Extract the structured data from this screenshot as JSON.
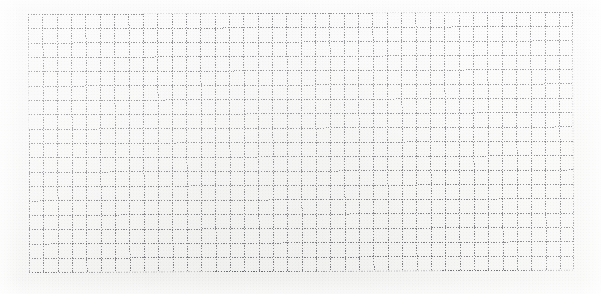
{
  "document": {
    "type": "graph-paper-sheet",
    "title": "",
    "content_text": "",
    "has_handwriting": false,
    "has_printed_text": false,
    "notes": ""
  },
  "canvas": {
    "width": 601,
    "height": 294,
    "background_color": "#fdfdfd",
    "paper_tone": "#fbfbfa"
  },
  "grid": {
    "line_color": "#5a5c60",
    "line_style": "dotted",
    "line_width_px": 1,
    "cell_size_px": 14.35,
    "columns": 38,
    "rows": 18,
    "origin_x": 28,
    "origin_y": 14,
    "width_px": 545,
    "height_px": 259,
    "rotation_deg": -0.25
  },
  "grid_data": {
    "type": "table",
    "title": "Empty graph paper grid",
    "columns": 38,
    "rows": 18,
    "cell_values": [],
    "annotations": [],
    "legend": []
  }
}
